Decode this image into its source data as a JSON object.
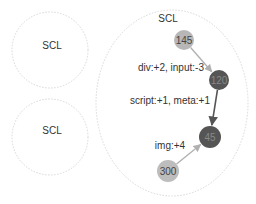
{
  "diagram": {
    "clusters": [
      {
        "id": "scl-left-top",
        "label": "SCL",
        "cx": 50,
        "cy": 50,
        "rx": 38,
        "ry": 38,
        "label_x": 52,
        "label_y": 49
      },
      {
        "id": "scl-left-bottom",
        "label": "SCL",
        "cx": 50,
        "cy": 137,
        "rx": 38,
        "ry": 38,
        "label_x": 52,
        "label_y": 134
      },
      {
        "id": "scl-main",
        "label": "SCL",
        "cx": 172,
        "cy": 103,
        "rx": 76,
        "ry": 93,
        "label_x": 168,
        "label_y": 22
      }
    ],
    "nodes": [
      {
        "id": "n145",
        "label": "145",
        "cx": 184,
        "cy": 40,
        "r": 10,
        "fill": "#b7b7b7",
        "text_color": "#444444"
      },
      {
        "id": "n120",
        "label": "120",
        "cx": 219,
        "cy": 80,
        "r": 10,
        "fill": "#555555",
        "text_color": "#888888"
      },
      {
        "id": "n45",
        "label": "45",
        "cx": 210,
        "cy": 137,
        "r": 11,
        "fill": "#555555",
        "text_color": "#888888"
      },
      {
        "id": "n300",
        "label": "300",
        "cx": 168,
        "cy": 171,
        "r": 11,
        "fill": "#bdbdbd",
        "text_color": "#444444"
      }
    ],
    "edges": [
      {
        "from": "n145",
        "to": "n120",
        "label": "div:+2, input:-3",
        "color": "#b0b0b0",
        "width": 1.3,
        "label_x": 171,
        "label_y": 71
      },
      {
        "from": "n120",
        "to": "n45",
        "label": "script:+1, meta:+1",
        "color": "#555555",
        "width": 1.6,
        "label_x": 170,
        "label_y": 104
      },
      {
        "from": "n300",
        "to": "n45",
        "label": "img:+4",
        "color": "#b0b0b0",
        "width": 1.3,
        "label_x": 170,
        "label_y": 149
      }
    ]
  },
  "colors": {
    "cluster_border": "#d8d8d8",
    "light_node": "#b9b9b9",
    "dark_node": "#555555",
    "light_edge": "#b0b0b0",
    "dark_edge": "#555555"
  }
}
